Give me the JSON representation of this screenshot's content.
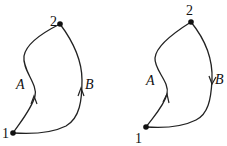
{
  "diagrams": [
    {
      "id": "left",
      "points": [
        {
          "label": "1"
        },
        {
          "label": "2"
        }
      ],
      "paths": [
        {
          "label": "A",
          "direction": "1 to 2"
        },
        {
          "label": "B",
          "direction": "1 to 2"
        }
      ]
    },
    {
      "id": "right",
      "points": [
        {
          "label": "1"
        },
        {
          "label": "2"
        }
      ],
      "paths": [
        {
          "label": "A",
          "direction": "1 to 2"
        },
        {
          "label": "B",
          "direction": "2 to 1"
        }
      ]
    }
  ],
  "colors": {
    "stroke": "#222222",
    "background": "#ffffff"
  }
}
